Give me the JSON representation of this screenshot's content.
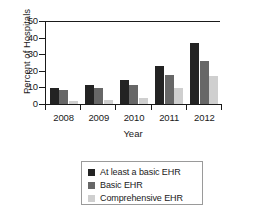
{
  "chart_data": {
    "type": "bar",
    "title": "",
    "subtitle": "",
    "xlabel": "Year",
    "ylabel": "Percent of Hospitals",
    "categories": [
      "2008",
      "2009",
      "2010",
      "2011",
      "2012"
    ],
    "series": [
      {
        "name": "At least a basic EHR",
        "color": "#232323",
        "values": [
          9.4,
          11.3,
          14.3,
          23.2,
          37.0
        ]
      },
      {
        "name": "Basic EHR",
        "color": "#676767",
        "values": [
          8.7,
          9.4,
          11.5,
          17.6,
          26.0
        ]
      },
      {
        "name": "Comprehensive EHR",
        "color": "#cfcfcf",
        "values": [
          1.8,
          2.7,
          3.6,
          9.5,
          17.0
        ]
      }
    ],
    "ylim": [
      0,
      50
    ],
    "yticks": [
      0,
      10,
      20,
      30,
      40,
      50
    ],
    "ytick_labels": [
      "0",
      "10",
      "20",
      "30",
      "40",
      "50"
    ],
    "grid": false,
    "legend_position": "bottom-center",
    "legend_entries": [
      "At least a basic EHR",
      "Basic EHR",
      "Comprehensive EHR"
    ]
  },
  "axes": {
    "y_title": "Percent of Hospitals",
    "x_title": "Year"
  }
}
